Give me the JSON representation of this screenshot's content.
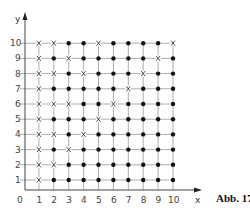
{
  "figure": {
    "caption": "Abb. 17",
    "x_axis_label": "x",
    "y_axis_label": "y",
    "origin_label": "0",
    "x_ticks": [
      "1",
      "2",
      "3",
      "4",
      "5",
      "6",
      "7",
      "8",
      "9",
      "10"
    ],
    "y_ticks": [
      "1",
      "2",
      "3",
      "4",
      "5",
      "6",
      "7",
      "8",
      "9",
      "10"
    ],
    "colors": {
      "line": "#555555",
      "grid": "#999999",
      "marker": "#111111"
    }
  },
  "chart_data": {
    "type": "scatter",
    "title": "",
    "xlabel": "x",
    "ylabel": "y",
    "xlim": [
      0,
      10
    ],
    "ylim": [
      0,
      10
    ],
    "grid": true,
    "legend": [],
    "caption": "Abb. 17",
    "marker_legend": {
      "X": "cross marker",
      "O": "filled dot marker"
    },
    "rows_top_to_bottom": [
      {
        "y": 10,
        "markers": [
          "X",
          "X",
          "O",
          "O",
          "X",
          "O",
          "O",
          "O",
          "O",
          "X"
        ]
      },
      {
        "y": 9,
        "markers": [
          "X",
          "O",
          "X",
          "O",
          "O",
          "O",
          "O",
          "O",
          "X",
          "O"
        ]
      },
      {
        "y": 8,
        "markers": [
          "X",
          "X",
          "O",
          "X",
          "O",
          "O",
          "O",
          "X",
          "O",
          "O"
        ]
      },
      {
        "y": 7,
        "markers": [
          "X",
          "O",
          "O",
          "O",
          "O",
          "O",
          "X",
          "O",
          "O",
          "O"
        ]
      },
      {
        "y": 6,
        "markers": [
          "X",
          "X",
          "X",
          "O",
          "O",
          "X",
          "O",
          "O",
          "O",
          "O"
        ]
      },
      {
        "y": 5,
        "markers": [
          "X",
          "O",
          "O",
          "O",
          "X",
          "O",
          "O",
          "O",
          "O",
          "O"
        ]
      },
      {
        "y": 4,
        "markers": [
          "X",
          "X",
          "O",
          "X",
          "O",
          "O",
          "O",
          "O",
          "O",
          "O"
        ]
      },
      {
        "y": 3,
        "markers": [
          "X",
          "O",
          "X",
          "O",
          "O",
          "O",
          "O",
          "O",
          "O",
          "O"
        ]
      },
      {
        "y": 2,
        "markers": [
          "X",
          "X",
          "O",
          "O",
          "O",
          "O",
          "O",
          "O",
          "O",
          "O"
        ]
      },
      {
        "y": 1,
        "markers": [
          "X",
          "O",
          "O",
          "O",
          "O",
          "O",
          "O",
          "O",
          "O",
          "O"
        ]
      }
    ],
    "series": [
      {
        "name": "cross",
        "points": [
          [
            1,
            10
          ],
          [
            2,
            10
          ],
          [
            5,
            10
          ],
          [
            10,
            10
          ],
          [
            1,
            9
          ],
          [
            3,
            9
          ],
          [
            9,
            9
          ],
          [
            1,
            8
          ],
          [
            2,
            8
          ],
          [
            4,
            8
          ],
          [
            8,
            8
          ],
          [
            1,
            7
          ],
          [
            7,
            7
          ],
          [
            1,
            6
          ],
          [
            2,
            6
          ],
          [
            3,
            6
          ],
          [
            6,
            6
          ],
          [
            1,
            5
          ],
          [
            5,
            5
          ],
          [
            1,
            4
          ],
          [
            2,
            4
          ],
          [
            4,
            4
          ],
          [
            1,
            3
          ],
          [
            3,
            3
          ],
          [
            1,
            2
          ],
          [
            2,
            2
          ],
          [
            1,
            1
          ]
        ]
      },
      {
        "name": "dot",
        "points": "all remaining integer lattice points (x,y) with 1<=x<=10, 1<=y<=10"
      }
    ]
  }
}
